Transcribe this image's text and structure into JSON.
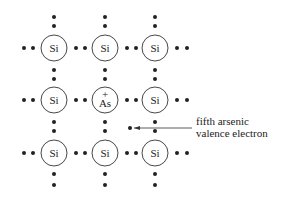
{
  "diagram": {
    "title": "",
    "lattice": [
      [
        {
          "symbol": "Si",
          "charge": ""
        },
        {
          "symbol": "Si",
          "charge": ""
        },
        {
          "symbol": "Si",
          "charge": ""
        }
      ],
      [
        {
          "symbol": "Si",
          "charge": ""
        },
        {
          "symbol": "As",
          "charge": "+"
        },
        {
          "symbol": "Si",
          "charge": ""
        }
      ],
      [
        {
          "symbol": "Si",
          "charge": ""
        },
        {
          "symbol": "Si",
          "charge": ""
        },
        {
          "symbol": "Si",
          "charge": ""
        }
      ]
    ],
    "annotation": {
      "line1": "fifth arsenic",
      "line2": "valence electron"
    },
    "colors": {
      "ink": "#222222",
      "background": "#ffffff"
    }
  }
}
